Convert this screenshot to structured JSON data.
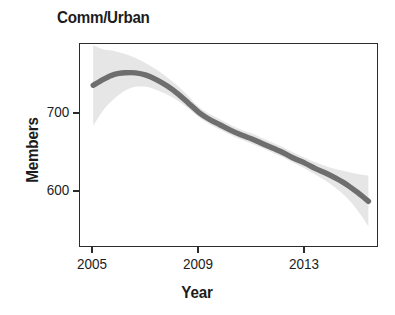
{
  "chart_data": {
    "type": "line",
    "title": "Comm/Urban",
    "xlabel": "Year",
    "ylabel": "Members",
    "grid": false,
    "legend": null,
    "xlim": [
      2004.5,
      2015.8
    ],
    "ylim": [
      528,
      790
    ],
    "xticks": [
      2005,
      2009,
      2013
    ],
    "xtick_labels": [
      "2005",
      "2009",
      "2013"
    ],
    "yticks": [
      600,
      700
    ],
    "ytick_labels": [
      "600",
      "700"
    ],
    "line_color": "#6e6e6e",
    "band_color": "#e6e6e6",
    "frame_color": "#2b2b2b",
    "series": [
      {
        "name": "Members (smoothed trend)",
        "x": [
          2005.0,
          2005.4,
          2005.8,
          2006.2,
          2006.6,
          2007.0,
          2007.4,
          2007.8,
          2008.2,
          2008.6,
          2009.0,
          2009.4,
          2009.8,
          2010.2,
          2010.6,
          2011.0,
          2011.4,
          2011.8,
          2012.2,
          2012.6,
          2013.0,
          2013.4,
          2013.8,
          2014.2,
          2014.6,
          2015.0,
          2015.4
        ],
        "values": [
          737,
          745,
          751,
          753,
          753,
          750,
          744,
          736,
          726,
          714,
          702,
          693,
          686,
          679,
          673,
          668,
          662,
          656,
          650,
          643,
          637,
          630,
          624,
          617,
          609,
          599,
          588
        ],
        "ci_lower": [
          685,
          706,
          720,
          730,
          735,
          735,
          731,
          725,
          717,
          707,
          696,
          687,
          680,
          673,
          667,
          662,
          656,
          650,
          644,
          637,
          630,
          622,
          614,
          604,
          592,
          576,
          556
        ],
        "ci_upper": [
          788,
          783,
          781,
          777,
          772,
          765,
          757,
          747,
          736,
          723,
          709,
          700,
          693,
          686,
          680,
          675,
          669,
          663,
          657,
          650,
          644,
          638,
          633,
          629,
          626,
          623,
          621
        ]
      }
    ]
  }
}
